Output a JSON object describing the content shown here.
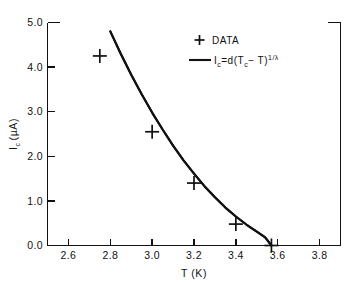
{
  "chart_data": {
    "type": "scatter",
    "title": "",
    "subtitle": "",
    "xlabel": "T (K)",
    "ylabel": "I_c (µA)",
    "xlim": [
      2.5,
      3.9
    ],
    "ylim": [
      0.0,
      5.0
    ],
    "grid": false,
    "legend_position": "top-right",
    "x_ticks": [
      2.6,
      2.8,
      3.0,
      3.2,
      3.4,
      3.6,
      3.8
    ],
    "x_tick_labels": [
      "2.6",
      "2.8",
      "3.0",
      "3.2",
      "3.4",
      "3.6",
      "3.8"
    ],
    "y_ticks": [
      0.0,
      1.0,
      2.0,
      3.0,
      4.0,
      5.0
    ],
    "y_tick_labels": [
      "0.0",
      "1.0",
      "2.0",
      "3.0",
      "4.0",
      "5.0"
    ],
    "series": [
      {
        "name": "DATA",
        "type": "scatter",
        "marker": "plus",
        "color": "#111111",
        "x": [
          2.75,
          3.0,
          3.2,
          3.4,
          3.57
        ],
        "y": [
          4.25,
          2.55,
          1.4,
          0.48,
          0.0
        ]
      },
      {
        "name": "I_c = d(T_c - T)^(1/lambda)",
        "type": "line",
        "color": "#111111",
        "x": [
          2.8,
          2.85,
          2.9,
          2.95,
          3.0,
          3.05,
          3.1,
          3.15,
          3.2,
          3.25,
          3.3,
          3.35,
          3.4,
          3.45,
          3.5,
          3.54,
          3.57
        ],
        "y": [
          4.8,
          4.3,
          3.83,
          3.39,
          2.98,
          2.6,
          2.24,
          1.91,
          1.61,
          1.33,
          1.08,
          0.85,
          0.65,
          0.47,
          0.31,
          0.18,
          0.0
        ]
      }
    ]
  },
  "axes": {
    "x_title": "T (K)",
    "y_title_main": "I",
    "y_title_sub": "c",
    "y_title_unit": "(µA)"
  },
  "legend": {
    "data_marker": "+",
    "data_label": "DATA",
    "fit_parts": {
      "i": "I",
      "i_sub": "c",
      "equals_d": "=d(",
      "tc": "T",
      "tc_sub": "c",
      "minus_t": "− T)",
      "exponent": "1/λ"
    }
  },
  "colors": {
    "background": "#ffffff",
    "ink": "#111111"
  }
}
